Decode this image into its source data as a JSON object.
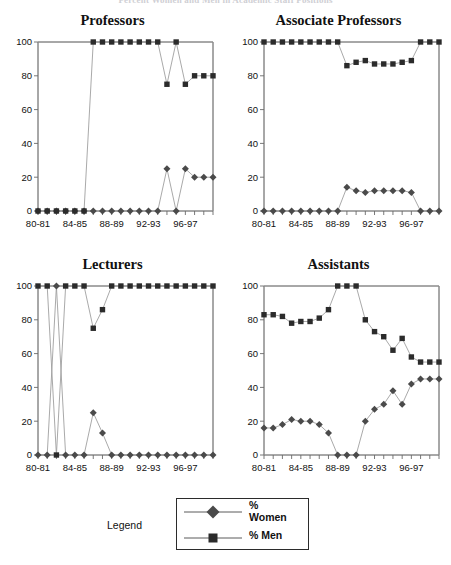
{
  "figure": {
    "top_title": "Percent Women and Men in Academic Staff Positions",
    "x_label_interval": 4
  },
  "legend": {
    "label": "Legend",
    "entries": [
      {
        "marker": "diamond",
        "label": "%\nWomen",
        "label_line1": "%",
        "label_line2": "Women",
        "color": "#4a4a4a"
      },
      {
        "marker": "square",
        "label": "% Men",
        "label_line1": "% Men",
        "label_line2": "",
        "color": "#2b2b2b"
      }
    ]
  },
  "chart_data": [
    {
      "type": "line",
      "title": "Professors",
      "xlabel": "",
      "ylabel": "",
      "ylim": [
        0,
        100
      ],
      "yticks": [
        0,
        20,
        40,
        60,
        80,
        100
      ],
      "grid": false,
      "legend_position": "external-bottom",
      "x": [
        "80-81",
        "81-82",
        "82-83",
        "83-84",
        "84-85",
        "85-86",
        "86-87",
        "87-88",
        "88-89",
        "89-90",
        "90-91",
        "91-92",
        "92-93",
        "93-94",
        "94-95",
        "95-96",
        "96-97",
        "97-98",
        "98-99",
        "99-00"
      ],
      "tick_labels": [
        "80-81",
        "",
        "",
        "",
        "84-85",
        "",
        "",
        "",
        "88-89",
        "",
        "",
        "",
        "92-93",
        "",
        "",
        "",
        "96-97",
        "",
        "",
        ""
      ],
      "series": [
        {
          "name": "% Women",
          "marker": "diamond",
          "color": "#4a4a4a",
          "values": [
            0,
            0,
            0,
            0,
            0,
            0,
            0,
            0,
            0,
            0,
            0,
            0,
            0,
            0,
            25,
            0,
            25,
            20,
            20,
            20
          ]
        },
        {
          "name": "% Men",
          "marker": "square",
          "color": "#2b2b2b",
          "values": [
            0,
            0,
            0,
            0,
            0,
            0,
            100,
            100,
            100,
            100,
            100,
            100,
            100,
            100,
            75,
            100,
            75,
            80,
            80,
            80
          ]
        }
      ]
    },
    {
      "type": "line",
      "title": "Associate Professors",
      "xlabel": "",
      "ylabel": "",
      "ylim": [
        0,
        100
      ],
      "yticks": [
        0,
        20,
        40,
        60,
        80,
        100
      ],
      "grid": false,
      "legend_position": "external-bottom",
      "x": [
        "80-81",
        "81-82",
        "82-83",
        "83-84",
        "84-85",
        "85-86",
        "86-87",
        "87-88",
        "88-89",
        "89-90",
        "90-91",
        "91-92",
        "92-93",
        "93-94",
        "94-95",
        "95-96",
        "96-97",
        "97-98",
        "98-99",
        "99-00"
      ],
      "tick_labels": [
        "80-81",
        "",
        "",
        "",
        "84-85",
        "",
        "",
        "",
        "88-89",
        "",
        "",
        "",
        "92-93",
        "",
        "",
        "",
        "96-97",
        "",
        "",
        ""
      ],
      "series": [
        {
          "name": "% Women",
          "marker": "diamond",
          "color": "#4a4a4a",
          "values": [
            0,
            0,
            0,
            0,
            0,
            0,
            0,
            0,
            0,
            14,
            12,
            11,
            12,
            12,
            12,
            12,
            11,
            0,
            0,
            0
          ]
        },
        {
          "name": "% Men",
          "marker": "square",
          "color": "#2b2b2b",
          "values": [
            100,
            100,
            100,
            100,
            100,
            100,
            100,
            100,
            100,
            86,
            88,
            89,
            87,
            87,
            87,
            88,
            89,
            100,
            100,
            100
          ]
        }
      ]
    },
    {
      "type": "line",
      "title": "Lecturers",
      "xlabel": "",
      "ylabel": "",
      "ylim": [
        0,
        100
      ],
      "yticks": [
        0,
        20,
        40,
        60,
        80,
        100
      ],
      "grid": false,
      "legend_position": "external-bottom",
      "x": [
        "80-81",
        "81-82",
        "82-83",
        "83-84",
        "84-85",
        "85-86",
        "86-87",
        "87-88",
        "88-89",
        "89-90",
        "90-91",
        "91-92",
        "92-93",
        "93-94",
        "94-95",
        "95-96",
        "96-97",
        "97-98",
        "98-99",
        "99-00"
      ],
      "tick_labels": [
        "80-81",
        "",
        "",
        "",
        "84-85",
        "",
        "",
        "",
        "88-89",
        "",
        "",
        "",
        "92-93",
        "",
        "",
        "",
        "96-97",
        "",
        "",
        ""
      ],
      "series": [
        {
          "name": "% Women",
          "marker": "diamond",
          "color": "#4a4a4a",
          "values": [
            0,
            0,
            100,
            0,
            0,
            0,
            25,
            13,
            0,
            0,
            0,
            0,
            0,
            0,
            0,
            0,
            0,
            0,
            0,
            0
          ]
        },
        {
          "name": "% Men",
          "marker": "square",
          "color": "#2b2b2b",
          "values": [
            100,
            100,
            0,
            100,
            100,
            100,
            75,
            86,
            100,
            100,
            100,
            100,
            100,
            100,
            100,
            100,
            100,
            100,
            100,
            100
          ]
        }
      ]
    },
    {
      "type": "line",
      "title": "Assistants",
      "xlabel": "",
      "ylabel": "",
      "ylim": [
        0,
        100
      ],
      "yticks": [
        0,
        20,
        40,
        60,
        80,
        100
      ],
      "grid": false,
      "legend_position": "external-bottom",
      "x": [
        "80-81",
        "81-82",
        "82-83",
        "83-84",
        "84-85",
        "85-86",
        "86-87",
        "87-88",
        "88-89",
        "89-90",
        "90-91",
        "91-92",
        "92-93",
        "93-94",
        "94-95",
        "95-96",
        "96-97",
        "97-98",
        "98-99",
        "99-00"
      ],
      "tick_labels": [
        "80-81",
        "",
        "",
        "",
        "84-85",
        "",
        "",
        "",
        "88-89",
        "",
        "",
        "",
        "92-93",
        "",
        "",
        "",
        "96-97",
        "",
        "",
        ""
      ],
      "series": [
        {
          "name": "% Women",
          "marker": "diamond",
          "color": "#4a4a4a",
          "values": [
            16,
            16,
            18,
            21,
            20,
            20,
            18,
            13,
            0,
            0,
            0,
            20,
            27,
            30,
            38,
            30,
            42,
            45,
            45,
            45
          ]
        },
        {
          "name": "% Men",
          "marker": "square",
          "color": "#2b2b2b",
          "values": [
            83,
            83,
            82,
            78,
            79,
            79,
            81,
            86,
            100,
            100,
            100,
            80,
            73,
            70,
            62,
            69,
            58,
            55,
            55,
            55
          ]
        }
      ]
    }
  ]
}
